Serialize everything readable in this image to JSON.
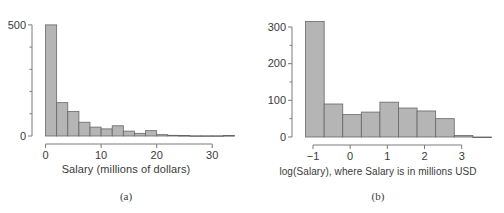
{
  "figure": {
    "panels": [
      {
        "id": "a",
        "caption": "(a)",
        "xlabel": "Salary (millions of dollars)"
      },
      {
        "id": "b",
        "caption": "(b)",
        "xlabel": "log(Salary), where Salary is in millions USD"
      }
    ],
    "style": {
      "bar_fill": "#b5b5b5",
      "bar_stroke": "#666666",
      "axis_color": "#7a7a7a",
      "text_color": "#3a3a3a",
      "background": "#ffffff"
    }
  },
  "chart_data": [
    {
      "type": "bar",
      "id": "panel-a",
      "title": "",
      "xlabel": "Salary (millions of dollars)",
      "ylabel": "",
      "xlim": [
        -1.0,
        35.0
      ],
      "ylim": [
        0,
        540
      ],
      "grid": false,
      "legend": null,
      "xticks": [
        0,
        10,
        20,
        30
      ],
      "xtick_labels": [
        "0",
        "10",
        "20",
        "30"
      ],
      "yticks": [
        0,
        500
      ],
      "ytick_labels": [
        "0",
        "500"
      ],
      "yticks_minor": [
        100,
        200,
        300,
        400
      ],
      "bin_width": 2,
      "bin_starts": [
        0,
        2,
        4,
        6,
        8,
        10,
        12,
        14,
        16,
        18,
        20,
        22,
        24,
        26,
        28,
        30,
        32
      ],
      "values": [
        500,
        150,
        110,
        62,
        40,
        32,
        46,
        22,
        12,
        24,
        6,
        3,
        2,
        1,
        1,
        1,
        2
      ],
      "categories": [
        "0-2",
        "2-4",
        "4-6",
        "6-8",
        "8-10",
        "10-12",
        "12-14",
        "14-16",
        "16-18",
        "18-20",
        "20-22",
        "22-24",
        "24-26",
        "26-28",
        "28-30",
        "30-32",
        "32-34"
      ]
    },
    {
      "type": "bar",
      "id": "panel-b",
      "title": "",
      "xlabel": "log(Salary), where Salary is in millions USD",
      "ylabel": "",
      "xlim": [
        -1.35,
        3.6
      ],
      "ylim": [
        0,
        330
      ],
      "grid": false,
      "legend": null,
      "xticks": [
        -1,
        0,
        1,
        2,
        3
      ],
      "xtick_labels": [
        "−1",
        "0",
        "1",
        "2",
        "3"
      ],
      "yticks": [
        0,
        100,
        200,
        300
      ],
      "ytick_labels": [
        "0",
        "100",
        "200",
        "300"
      ],
      "yticks_minor": [
        50,
        150,
        250
      ],
      "bin_width": 0.5,
      "bin_starts": [
        -1.2,
        -0.7,
        -0.2,
        0.3,
        0.8,
        1.3,
        1.8,
        2.3,
        2.8,
        3.3
      ],
      "values": [
        315,
        90,
        61,
        68,
        95,
        79,
        71,
        50,
        4,
        0
      ],
      "categories": [
        "-1.2 to -0.7",
        "-0.7 to -0.2",
        "-0.2 to 0.3",
        "0.3 to 0.8",
        "0.8 to 1.3",
        "1.3 to 1.8",
        "1.8 to 2.3",
        "2.3 to 2.8",
        "2.8 to 3.3",
        "3.3 to 3.8"
      ]
    }
  ]
}
